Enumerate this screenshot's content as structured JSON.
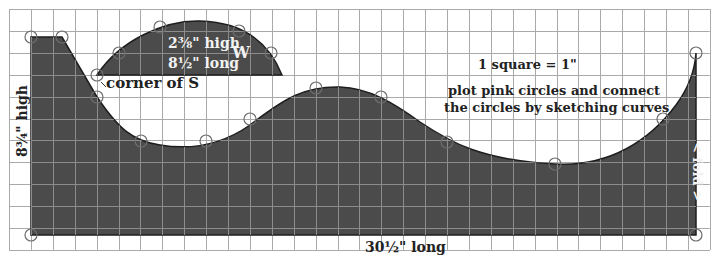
{
  "diagram": {
    "type": "pattern-grid",
    "scale_label": "1 square = 1\"",
    "instructions_line1": "plot pink circles and connect",
    "instructions_line2": "the circles by sketching curves",
    "height_label": "8¾\" high",
    "length_label": "30½\" long",
    "fold_label": "< fold >",
    "corner_label": "corner of S",
    "w_piece": {
      "letter": "W",
      "height_label": "2⅜\" high",
      "length_label": "8½\" long"
    },
    "colors": {
      "fill": "#4b4b4b",
      "grid": "#aaaaaa",
      "grid_over_fill": "#8c8c8c",
      "outline": "#1e1e1e",
      "circle": "#6d6d6d",
      "background": "#ffffff"
    },
    "grid": {
      "origin_x": 9,
      "origin_y": 9,
      "cell": 21.9,
      "cols": 32,
      "rows": 11
    },
    "s_piece_circles": [
      [
        31,
        37
      ],
      [
        62,
        37
      ],
      [
        97,
        97
      ],
      [
        141,
        141
      ],
      [
        206,
        141
      ],
      [
        250,
        119
      ],
      [
        316,
        88
      ],
      [
        381,
        97
      ],
      [
        447,
        142
      ],
      [
        555,
        164
      ],
      [
        663,
        119
      ],
      [
        696,
        53
      ],
      [
        696,
        235
      ],
      [
        31,
        235
      ]
    ],
    "w_piece_circles": [
      [
        97,
        75
      ],
      [
        119,
        53
      ],
      [
        160,
        27
      ],
      [
        239,
        31
      ],
      [
        271,
        53
      ]
    ]
  }
}
